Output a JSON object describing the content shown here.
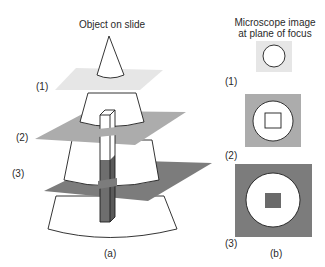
{
  "figure": {
    "panel_a": {
      "title": "Object on slide",
      "caption": "(a)",
      "plane_labels": [
        "(1)",
        "(2)",
        "(3)"
      ]
    },
    "panel_b": {
      "title_line1": "Microscope image",
      "title_line2": "at plane of focus",
      "caption": "(b)",
      "image_labels": [
        "(1)",
        "(2)",
        "(3)"
      ]
    },
    "colors": {
      "plane1": "#e6e6e6",
      "plane2": "#acacac",
      "plane3": "#7c7c7c",
      "bar_dark": "#6e6e6e",
      "outline": "#1e1e1e",
      "background": "#ffffff"
    }
  }
}
